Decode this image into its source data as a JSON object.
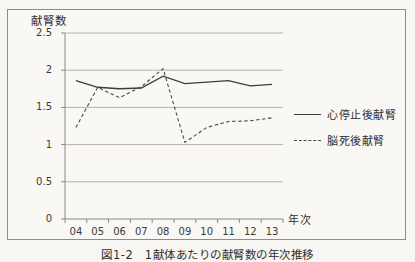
{
  "figure": {
    "title": "献腎数",
    "x_axis_label": "年次",
    "caption": "図1-2　1献体あたりの献腎数の年次推移",
    "legend": [
      {
        "label": "心停止後献腎",
        "style": "solid"
      },
      {
        "label": "脳死後献腎",
        "style": "dashed"
      }
    ]
  },
  "chart_data": {
    "type": "line",
    "title": "献腎数",
    "xlabel": "年次",
    "ylabel": "献腎数",
    "categories": [
      "04",
      "05",
      "06",
      "07",
      "08",
      "09",
      "10",
      "11",
      "12",
      "13"
    ],
    "series": [
      {
        "name": "心停止後献腎",
        "style": "solid",
        "values": [
          1.86,
          1.77,
          1.75,
          1.76,
          1.92,
          1.82,
          1.84,
          1.86,
          1.79,
          1.81
        ]
      },
      {
        "name": "脳死後献腎",
        "style": "dashed",
        "values": [
          1.23,
          1.77,
          1.63,
          1.78,
          2.02,
          1.03,
          1.23,
          1.31,
          1.32,
          1.36
        ]
      }
    ],
    "ylim": [
      0,
      2.5
    ],
    "yticks": [
      0,
      0.5,
      1,
      1.5,
      2,
      2.5
    ],
    "ytick_labels": [
      "0",
      "0.5",
      "1",
      "1.5",
      "2",
      "2.5"
    ],
    "grid": true,
    "legend_position": "right"
  },
  "colors": {
    "background": "#f7f6f2",
    "border": "#8f8d88",
    "grid": "#b5b2ac",
    "axis": "#8a8881",
    "line_solid": "#3d3d3d",
    "line_dashed": "#4a4a4a",
    "text": "#2e2e2e"
  }
}
